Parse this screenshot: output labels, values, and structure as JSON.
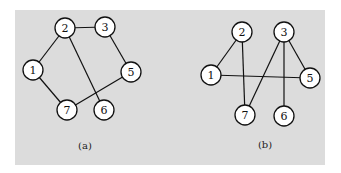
{
  "figure": {
    "background": "#dcdcdc",
    "panel": {
      "x": 15,
      "y": 10,
      "width": 310,
      "height": 155
    },
    "node_radius": 10,
    "node_fill": "#ffffff",
    "stroke": "#111111"
  },
  "graphs": [
    {
      "id": "a",
      "label": "(a)",
      "label_pos": [
        85,
        149
      ],
      "nodes": [
        {
          "id": "1",
          "label": "1",
          "x": 33,
          "y": 70
        },
        {
          "id": "2",
          "label": "2",
          "x": 65,
          "y": 28
        },
        {
          "id": "3",
          "label": "3",
          "x": 105,
          "y": 27
        },
        {
          "id": "5",
          "label": "5",
          "x": 131,
          "y": 72
        },
        {
          "id": "6",
          "label": "6",
          "x": 104,
          "y": 110
        },
        {
          "id": "7",
          "label": "7",
          "x": 67,
          "y": 110
        }
      ],
      "edges": [
        [
          "2",
          "3"
        ],
        [
          "2",
          "1"
        ],
        [
          "2",
          "6"
        ],
        [
          "3",
          "5"
        ],
        [
          "1",
          "7"
        ],
        [
          "7",
          "5"
        ]
      ]
    },
    {
      "id": "b",
      "label": "(b)",
      "label_pos": [
        265,
        148
      ],
      "nodes": [
        {
          "id": "1",
          "label": "1",
          "x": 211,
          "y": 75
        },
        {
          "id": "2",
          "label": "2",
          "x": 242,
          "y": 32
        },
        {
          "id": "3",
          "label": "3",
          "x": 284,
          "y": 32
        },
        {
          "id": "5",
          "label": "5",
          "x": 310,
          "y": 78
        },
        {
          "id": "6",
          "label": "6",
          "x": 284,
          "y": 116
        },
        {
          "id": "7",
          "label": "7",
          "x": 245,
          "y": 115
        }
      ],
      "edges": [
        [
          "2",
          "1"
        ],
        [
          "2",
          "7"
        ],
        [
          "3",
          "7"
        ],
        [
          "3",
          "6"
        ],
        [
          "3",
          "5"
        ],
        [
          "1",
          "5"
        ]
      ]
    }
  ]
}
